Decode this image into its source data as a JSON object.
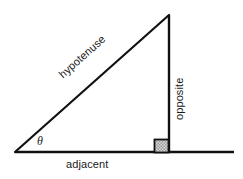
{
  "diagram": {
    "type": "geometry-figure",
    "background_color": "#ffffff",
    "stroke_color": "#111111",
    "text_color": "#1a1a1a",
    "right_angle_fill": "#c8c8c8",
    "labels": {
      "hypotenuse": "hypotenuse",
      "opposite": "opposite",
      "adjacent": "adjacent",
      "theta": "θ"
    },
    "geometry": {
      "vertex_angle": [
        15,
        152
      ],
      "vertex_apex": [
        169,
        15
      ],
      "vertex_right": [
        169,
        152
      ],
      "baseline_start": [
        15,
        152
      ],
      "baseline_end": [
        234,
        152
      ],
      "right_angle_marker": {
        "x": 154,
        "y": 139,
        "size": 14
      }
    },
    "label_rotation": {
      "hypotenuse_deg": -41.7,
      "opposite_deg": -90,
      "adjacent_deg": 0
    }
  }
}
